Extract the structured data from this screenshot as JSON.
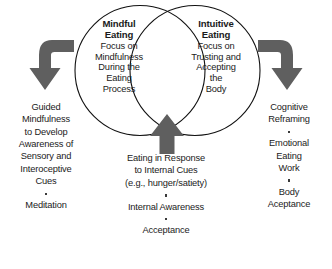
{
  "diagram": {
    "colors": {
      "background": "#ffffff",
      "circle_stroke": "#111111",
      "arrow_fill": "#5f5f5f",
      "text": "#1b1b1b",
      "bullet": "#3a3a3a"
    },
    "left_circle": {
      "heading": "Mindful\nEating",
      "body": "Focus on\nMindfulness\nDuring the\nEating\nProcess"
    },
    "right_circle": {
      "heading": "Intuitive\nEating",
      "body": "Focus on\nTrusting and\nAccepting\nthe\nBody"
    },
    "left_column": {
      "items": [
        "Guided\nMindfulness\nto Develop\nAwareness of\nSensory and\nInteroceptive\nCues",
        "Meditation"
      ]
    },
    "right_column": {
      "items": [
        "Cognitive\nReframing",
        "Emotional\nEating\nWork",
        "Body\nAceptance"
      ]
    },
    "bottom_column": {
      "items": [
        "Eating in Response\nto Internal Cues\n(e.g., hunger/satiety)",
        "Internal Awareness",
        "Acceptance"
      ]
    },
    "arrows": {
      "left": "curved-arrow-down-left-icon",
      "right": "curved-arrow-down-right-icon",
      "center": "arrow-up-icon"
    }
  }
}
